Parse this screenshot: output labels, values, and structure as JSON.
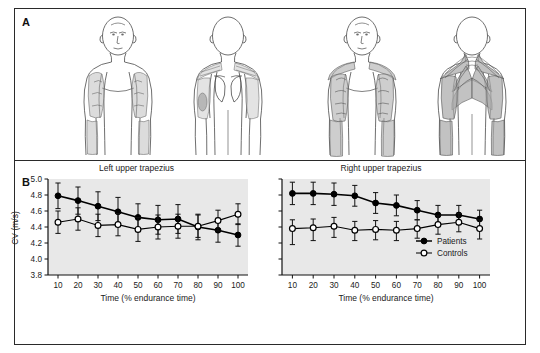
{
  "figure": {
    "panel_a_letter": "A",
    "panel_b_letter": "B"
  },
  "panel_a": {
    "name": "anatomical-diagrams",
    "figures": [
      {
        "id": "fig-a1",
        "view": "anterior",
        "group": "left-set",
        "shading": "light"
      },
      {
        "id": "fig-a2",
        "view": "posterior",
        "group": "left-set",
        "shading": "light"
      },
      {
        "id": "fig-a3",
        "view": "anterior",
        "group": "right-set",
        "shading": "moderate"
      },
      {
        "id": "fig-a4",
        "view": "posterior",
        "group": "right-set",
        "shading": "heavy"
      }
    ]
  },
  "chart_data": [
    {
      "type": "line",
      "id": "left-upper-trapezius",
      "title": "Left upper trapezius",
      "xlabel": "Time (% endurance time)",
      "ylabel": "CV (m/s)",
      "x": [
        10,
        20,
        30,
        40,
        50,
        60,
        70,
        80,
        90,
        100
      ],
      "xlim": [
        5,
        105
      ],
      "ylim": [
        3.8,
        5.0
      ],
      "yticks": [
        3.8,
        4.0,
        4.2,
        4.4,
        4.6,
        4.8,
        5.0
      ],
      "ytick_labels": [
        "3.8",
        "4.0",
        "4.2",
        "4.4",
        "4.6",
        "4.8",
        "5.0"
      ],
      "xticks": [
        10,
        20,
        30,
        40,
        50,
        60,
        70,
        80,
        90,
        100
      ],
      "xtick_labels": [
        "10",
        "20",
        "30",
        "40",
        "50",
        "60",
        "70",
        "80",
        "90",
        "100"
      ],
      "grid": false,
      "plot_background": "#e8e8e8",
      "legend": false,
      "series": [
        {
          "name": "Patients",
          "marker": "filled-circle",
          "color": "#000000",
          "values": [
            4.79,
            4.73,
            4.66,
            4.59,
            4.52,
            4.49,
            4.5,
            4.4,
            4.36,
            4.3
          ],
          "err_up": [
            0.16,
            0.17,
            0.18,
            0.18,
            0.17,
            0.18,
            0.18,
            0.16,
            0.15,
            0.14
          ],
          "err_dn": [
            0.16,
            0.17,
            0.18,
            0.18,
            0.17,
            0.18,
            0.18,
            0.16,
            0.15,
            0.14
          ]
        },
        {
          "name": "Controls",
          "marker": "open-circle",
          "color": "#000000",
          "values": [
            4.46,
            4.5,
            4.42,
            4.43,
            4.37,
            4.4,
            4.41,
            4.41,
            4.48,
            4.56
          ],
          "err_up": [
            0.14,
            0.14,
            0.14,
            0.14,
            0.15,
            0.15,
            0.15,
            0.14,
            0.13,
            0.13
          ],
          "err_dn": [
            0.14,
            0.14,
            0.14,
            0.14,
            0.15,
            0.15,
            0.15,
            0.14,
            0.13,
            0.13
          ]
        }
      ]
    },
    {
      "type": "line",
      "id": "right-upper-trapezius",
      "title": "Right upper trapezius",
      "xlabel": "Time (% endurance time)",
      "ylabel": "",
      "x": [
        10,
        20,
        30,
        40,
        50,
        60,
        70,
        80,
        90,
        100
      ],
      "xlim": [
        5,
        105
      ],
      "ylim": [
        3.8,
        5.0
      ],
      "yticks": [
        3.8,
        4.0,
        4.2,
        4.4,
        4.6,
        4.8,
        5.0
      ],
      "ytick_labels": [
        "",
        "",
        "",
        "",
        "",
        "",
        ""
      ],
      "xticks": [
        10,
        20,
        30,
        40,
        50,
        60,
        70,
        80,
        90,
        100
      ],
      "xtick_labels": [
        "10",
        "20",
        "30",
        "40",
        "50",
        "60",
        "70",
        "80",
        "90",
        "100"
      ],
      "grid": false,
      "plot_background": "#e8e8e8",
      "legend": true,
      "legend_position": "bottom-right",
      "series": [
        {
          "name": "Patients",
          "marker": "filled-circle",
          "color": "#000000",
          "values": [
            4.82,
            4.82,
            4.81,
            4.79,
            4.7,
            4.67,
            4.61,
            4.55,
            4.55,
            4.5
          ],
          "err_up": [
            0.14,
            0.14,
            0.14,
            0.13,
            0.13,
            0.13,
            0.12,
            0.12,
            0.12,
            0.11
          ],
          "err_dn": [
            0.14,
            0.14,
            0.14,
            0.13,
            0.13,
            0.13,
            0.12,
            0.12,
            0.12,
            0.11
          ]
        },
        {
          "name": "Controls",
          "marker": "open-circle",
          "color": "#000000",
          "values": [
            4.38,
            4.39,
            4.41,
            4.36,
            4.37,
            4.36,
            4.38,
            4.43,
            4.46,
            4.38
          ],
          "err_up": [
            0.11,
            0.11,
            0.11,
            0.11,
            0.11,
            0.11,
            0.11,
            0.11,
            0.11,
            0.11
          ],
          "err_dn": [
            0.2,
            0.16,
            0.14,
            0.13,
            0.13,
            0.13,
            0.12,
            0.12,
            0.12,
            0.13
          ]
        }
      ]
    }
  ],
  "legend": {
    "patients_label": "Patients",
    "controls_label": "Controls"
  }
}
